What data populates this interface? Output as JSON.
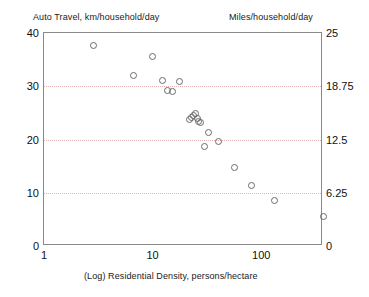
{
  "chart_data": {
    "type": "scatter",
    "title": "",
    "left_axis_title": "Auto Travel, km/household/day",
    "right_axis_title": "Miles/household/day",
    "xlabel": "(Log) Residential Density, persons/hectare",
    "ylabel": "Auto Travel, km/household/day",
    "xscale": "log",
    "xlim": [
      1,
      370
    ],
    "ylim": [
      0,
      40
    ],
    "ylim_right": [
      0,
      25
    ],
    "grid": true,
    "legend": null,
    "xticks": [
      "1",
      "10",
      "100"
    ],
    "xtick_values": [
      1,
      10,
      100
    ],
    "yticks_left": [
      "0",
      "10",
      "20",
      "30",
      "40"
    ],
    "ytick_values_left": [
      0,
      10,
      20,
      30,
      40
    ],
    "yticks_right": [
      "0",
      "6.25",
      "12.5",
      "18.75",
      "25"
    ],
    "ytick_values_right": [
      0,
      6.25,
      12.5,
      18.75,
      25
    ],
    "gridline_values": [
      10,
      20,
      30
    ],
    "marker": "open-circle",
    "marker_color": "#6b6b6b",
    "series": [
      {
        "name": "cities",
        "x": [
          2.8,
          6.6,
          9.9,
          12.2,
          13.6,
          15.0,
          17.6,
          21.5,
          22.6,
          23.7,
          24.3,
          25.5,
          26.2,
          27.2,
          30.0,
          32.0,
          40.0,
          56.0,
          81.0,
          130.0,
          370.0
        ],
        "y": [
          37.8,
          32.2,
          35.7,
          31.2,
          29.3,
          29.1,
          31.0,
          23.9,
          24.2,
          24.6,
          24.9,
          24.1,
          23.4,
          23.3,
          18.8,
          21.4,
          19.8,
          14.9,
          11.5,
          8.6,
          5.6
        ]
      }
    ]
  },
  "axis_titles": {
    "left": "Auto Travel, km/household/day",
    "right": "Miles/household/day",
    "bottom": "(Log) Residential Density, persons/hectare"
  },
  "colors": {
    "frame": "#8a8a8a",
    "grid": "#e2b6b6",
    "marker": "#6b6b6b",
    "text": "#111111",
    "background": "#ffffff"
  }
}
